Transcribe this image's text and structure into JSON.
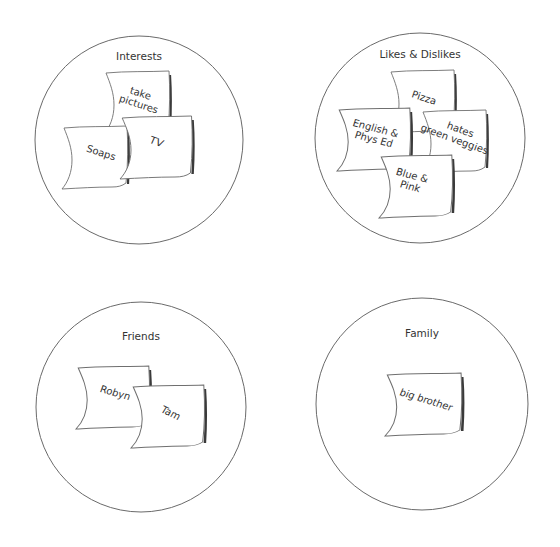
{
  "diagram": {
    "groups": [
      {
        "title": "Interests",
        "notes": [
          {
            "lines": [
              "take",
              "pictures"
            ]
          },
          {
            "lines": [
              "Soaps"
            ]
          },
          {
            "lines": [
              "TV"
            ]
          }
        ]
      },
      {
        "title": "Likes & Dislikes",
        "notes": [
          {
            "lines": [
              "Pizza"
            ]
          },
          {
            "lines": [
              "English &",
              "Phys Ed"
            ]
          },
          {
            "lines": [
              "hates",
              "green veggies"
            ]
          },
          {
            "lines": [
              "Blue &",
              "Pink"
            ]
          }
        ]
      },
      {
        "title": "Friends",
        "notes": [
          {
            "lines": [
              "Robyn"
            ]
          },
          {
            "lines": [
              "Tam"
            ]
          }
        ]
      },
      {
        "title": "Family",
        "notes": [
          {
            "lines": [
              "big brother"
            ]
          }
        ]
      }
    ]
  },
  "colors": {
    "background": "#ffffff",
    "outline": "#6a6a6a",
    "note_shadow": "#3a3a3a",
    "text": "#333333"
  }
}
